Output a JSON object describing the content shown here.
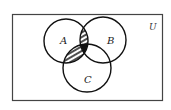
{
  "diagram": {
    "type": "venn",
    "universe_label": "U",
    "sets": [
      {
        "id": "A",
        "label": "A",
        "cx": 66,
        "cy": 41,
        "r": 22
      },
      {
        "id": "B",
        "label": "B",
        "cx": 103,
        "cy": 40,
        "r": 23
      },
      {
        "id": "C",
        "label": "C",
        "cx": 87,
        "cy": 68,
        "r": 24
      }
    ],
    "shaded_regions": [
      {
        "region": "A∩B∩C'",
        "style": "hatched"
      },
      {
        "region": "A∩C∩B'",
        "style": "hatched"
      },
      {
        "region": "A∩B∩C",
        "style": "solid"
      }
    ],
    "colors": {
      "stroke": "#111111",
      "fill_solid": "#111111",
      "hatch": "#222222",
      "background": "#ffffff"
    }
  }
}
